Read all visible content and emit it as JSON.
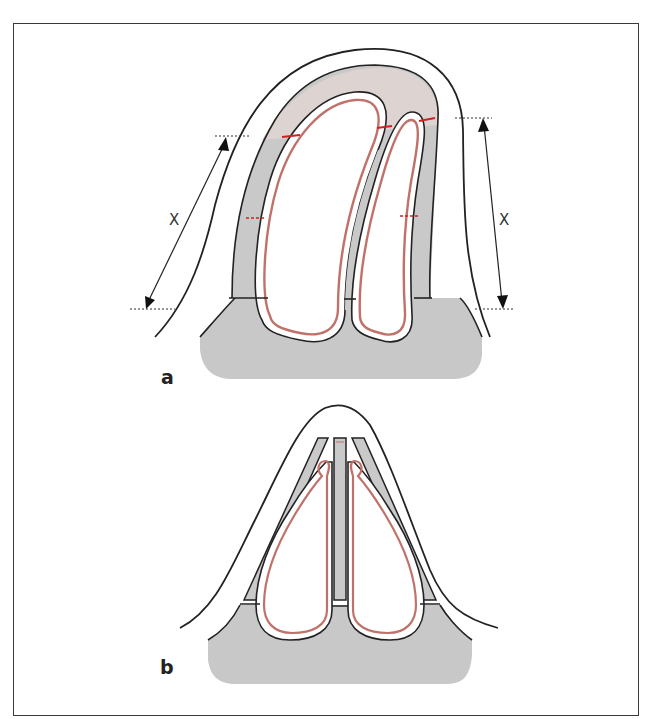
{
  "figure": {
    "panels": [
      {
        "id": "a",
        "label": "a",
        "measurements": [
          {
            "side": "left",
            "label": "X"
          },
          {
            "side": "right",
            "label": "X"
          }
        ]
      },
      {
        "id": "b",
        "label": "b"
      }
    ],
    "colors": {
      "outline": "#222222",
      "tissue_gray": "#c9c9c9",
      "tissue_light": "#ddd5d3",
      "mucosa_red": "#c0726a",
      "cut_line_red": "#cc2222",
      "frame": "#3a3a3a"
    }
  }
}
